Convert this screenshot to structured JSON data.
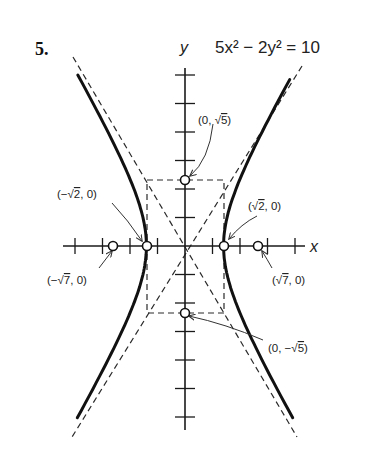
{
  "problem_number": "5.",
  "equation": "5x² − 2y² = 10",
  "axes": {
    "x_label": "x",
    "y_label": "y"
  },
  "point_labels": [
    {
      "id": "top-vertex-box",
      "before": "(0, ",
      "radical": "√",
      "radicand": "5",
      "after": ")"
    },
    {
      "id": "left-vertex",
      "before": "(−",
      "radical": "√",
      "radicand": "2",
      "after": ", 0)"
    },
    {
      "id": "right-vertex",
      "before": "(",
      "radical": "√",
      "radicand": "2",
      "after": ", 0)"
    },
    {
      "id": "left-focus",
      "before": "(−",
      "radical": "√",
      "radicand": "7",
      "after": ", 0)"
    },
    {
      "id": "right-focus",
      "before": "(",
      "radical": "√",
      "radicand": "7",
      "after": ", 0)"
    },
    {
      "id": "bottom-vertex-box",
      "before": "(0, −",
      "radical": "√",
      "radicand": "5",
      "after": ")"
    }
  ],
  "chart_data": {
    "type": "line",
    "xlabel": "x",
    "ylabel": "y",
    "x_ticks": [
      -4,
      -3,
      -2,
      -1,
      1,
      2,
      3,
      4
    ],
    "y_ticks": [
      -6,
      -5,
      -4,
      -3,
      -2,
      -1,
      1,
      2,
      3,
      4,
      5,
      6
    ],
    "xlim": [
      -4.3,
      4.4
    ],
    "ylim": [
      -6.5,
      6.3
    ],
    "grid": false,
    "series": [
      {
        "name": "hyperbola (right branch)",
        "style": "solid-thick",
        "param": "x = sqrt(2)·cosh t, y = sqrt(5)·sinh t"
      },
      {
        "name": "hyperbola (left branch)",
        "style": "solid-thick",
        "param": "x = -sqrt(2)·cosh t, y = sqrt(5)·sinh t"
      },
      {
        "name": "asymptote",
        "style": "dashed",
        "equation": "y = sqrt(5/2)·x"
      },
      {
        "name": "asymptote",
        "style": "dashed",
        "equation": "y = -sqrt(5/2)·x"
      },
      {
        "name": "central rectangle",
        "style": "dashed",
        "corners": [
          [
            -1.414,
            2.236
          ],
          [
            1.414,
            2.236
          ],
          [
            1.414,
            -2.236
          ],
          [
            -1.414,
            -2.236
          ]
        ]
      }
    ],
    "points": [
      {
        "label": "(0, √5)",
        "x": 0,
        "y": 2.236,
        "marker": "open-circle"
      },
      {
        "label": "(−√2, 0)",
        "x": -1.414,
        "y": 0,
        "marker": "open-circle"
      },
      {
        "label": "(√2, 0)",
        "x": 1.414,
        "y": 0,
        "marker": "open-circle"
      },
      {
        "label": "(−√7, 0)",
        "x": -2.646,
        "y": 0,
        "marker": "open-circle"
      },
      {
        "label": "(√7, 0)",
        "x": 2.646,
        "y": 0,
        "marker": "open-circle"
      },
      {
        "label": "(0, −√5)",
        "x": 0,
        "y": -2.236,
        "marker": "open-circle"
      }
    ]
  }
}
